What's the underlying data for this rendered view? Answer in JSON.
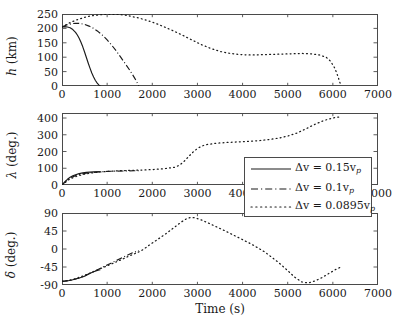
{
  "figure": {
    "xlabel": "Time (s)",
    "background": "#ffffff",
    "axis_color": "#4a4a4a",
    "curve_color": "#1a1a1a"
  },
  "legend": {
    "position": "center-right",
    "entries": [
      {
        "label": "Δv = 0.15v",
        "sub": "p",
        "style": "solid",
        "name": "legend-entry-0-15vp"
      },
      {
        "label": "Δv = 0.1v",
        "sub": "p",
        "style": "dashdot",
        "name": "legend-entry-0-1vp"
      },
      {
        "label": "Δv = 0.0895v",
        "sub": "p",
        "style": "dotted",
        "name": "legend-entry-0-0895vp"
      }
    ]
  },
  "chart_data": [
    {
      "type": "line",
      "panel": "top",
      "title": "",
      "xlabel": "",
      "ylabel": "h (km)",
      "ylabel_symbol": "h",
      "ylabel_unit": "(km)",
      "xlim": [
        0,
        7000
      ],
      "ylim": [
        0,
        250
      ],
      "xticks": [
        0,
        1000,
        2000,
        3000,
        4000,
        5000,
        6000,
        7000
      ],
      "yticks": [
        0,
        50,
        100,
        150,
        200,
        250
      ],
      "grid": false,
      "series": [
        {
          "name": "Δv = 0.15v_p",
          "style": "solid",
          "x": [
            0,
            60,
            120,
            180,
            240,
            300,
            340,
            380,
            420,
            460,
            500,
            540,
            580,
            620,
            660,
            700,
            740,
            780,
            820,
            850
          ],
          "y": [
            205,
            206,
            205,
            202,
            196,
            186,
            177,
            166,
            152,
            136,
            118,
            99,
            80,
            62,
            45,
            31,
            19,
            10,
            3,
            0
          ]
        },
        {
          "name": "Δv = 0.1v_p",
          "style": "dashdot",
          "x": [
            0,
            100,
            200,
            300,
            400,
            500,
            600,
            700,
            800,
            900,
            1000,
            1100,
            1200,
            1300,
            1400,
            1500,
            1600,
            1650,
            1700
          ],
          "y": [
            205,
            212,
            216,
            218,
            217,
            214,
            208,
            200,
            189,
            176,
            160,
            142,
            122,
            100,
            78,
            55,
            30,
            16,
            0
          ]
        },
        {
          "name": "Δv = 0.0895v_p",
          "style": "dotted",
          "x": [
            0,
            150,
            300,
            450,
            600,
            750,
            900,
            1050,
            1200,
            1350,
            1500,
            1700,
            1900,
            2100,
            2300,
            2500,
            2700,
            2900,
            3100,
            3300,
            3500,
            3700,
            3900,
            4100,
            4300,
            4500,
            4700,
            4900,
            5100,
            5300,
            5500,
            5700,
            5850,
            5950,
            6050,
            6120,
            6180
          ],
          "y": [
            205,
            218,
            228,
            236,
            242,
            246,
            248,
            249,
            249,
            247,
            243,
            236,
            227,
            216,
            203,
            189,
            174,
            158,
            143,
            130,
            120,
            114,
            110,
            108,
            108,
            109,
            110,
            111,
            112,
            113,
            112,
            108,
            100,
            86,
            60,
            30,
            0
          ]
        }
      ]
    },
    {
      "type": "line",
      "panel": "middle",
      "title": "",
      "xlabel": "",
      "ylabel": "λ (deg.)",
      "ylabel_symbol": "λ",
      "ylabel_unit": "(deg.)",
      "xlim": [
        0,
        7000
      ],
      "ylim": [
        0,
        430
      ],
      "xticks": [
        0,
        1000,
        2000,
        3000,
        4000,
        5000,
        6000,
        7000
      ],
      "yticks": [
        0,
        100,
        200,
        300,
        400
      ],
      "grid": false,
      "series": [
        {
          "name": "Δv = 0.15v_p",
          "style": "solid",
          "x": [
            0,
            60,
            120,
            180,
            240,
            300,
            380,
            460,
            540,
            620,
            700,
            780,
            850
          ],
          "y": [
            0,
            18,
            34,
            46,
            55,
            61,
            68,
            72,
            75,
            77,
            78,
            79,
            79
          ]
        },
        {
          "name": "Δv = 0.1v_p",
          "style": "dashdot",
          "x": [
            0,
            100,
            200,
            300,
            400,
            500,
            600,
            800,
            1000,
            1200,
            1400,
            1600,
            1700
          ],
          "y": [
            0,
            26,
            44,
            56,
            64,
            69,
            73,
            78,
            81,
            83,
            84,
            85,
            85
          ]
        },
        {
          "name": "Δv = 0.0895v_p",
          "style": "dotted",
          "x": [
            0,
            150,
            300,
            450,
            600,
            800,
            1000,
            1250,
            1500,
            1750,
            2000,
            2250,
            2500,
            2600,
            2700,
            2800,
            2900,
            3000,
            3100,
            3200,
            3400,
            3600,
            3800,
            4000,
            4200,
            4400,
            4600,
            4800,
            5000,
            5200,
            5400,
            5600,
            5800,
            6000,
            6180
          ],
          "y": [
            0,
            32,
            50,
            62,
            70,
            77,
            81,
            85,
            87,
            89,
            92,
            97,
            106,
            118,
            140,
            168,
            196,
            218,
            233,
            241,
            249,
            253,
            256,
            259,
            262,
            266,
            272,
            280,
            292,
            310,
            335,
            362,
            385,
            400,
            408
          ]
        }
      ]
    },
    {
      "type": "line",
      "panel": "bottom",
      "title": "",
      "xlabel": "Time (s)",
      "ylabel": "δ (deg.)",
      "ylabel_symbol": "δ",
      "ylabel_unit": "(deg.)",
      "xlim": [
        0,
        7000
      ],
      "ylim": [
        -90,
        90
      ],
      "xticks": [
        0,
        1000,
        2000,
        3000,
        4000,
        5000,
        6000,
        7000
      ],
      "yticks": [
        -90,
        -45,
        0,
        45,
        90
      ],
      "grid": false,
      "series": [
        {
          "name": "Δv = 0.15v_p",
          "style": "solid",
          "x": [
            0,
            100,
            200,
            300,
            400,
            500,
            600,
            700,
            800,
            850
          ],
          "y": [
            -81,
            -80,
            -78,
            -75,
            -72,
            -68,
            -62,
            -57,
            -53,
            -52
          ]
        },
        {
          "name": "Δv = 0.1v_p",
          "style": "dashdot",
          "x": [
            0,
            200,
            400,
            600,
            800,
            1000,
            1200,
            1400,
            1550,
            1700
          ],
          "y": [
            -81,
            -78,
            -72,
            -62,
            -51,
            -40,
            -29,
            -18,
            -10,
            -4
          ]
        },
        {
          "name": "Δv = 0.0895v_p",
          "style": "dotted",
          "x": [
            0,
            250,
            500,
            750,
            1000,
            1250,
            1500,
            1750,
            2000,
            2250,
            2500,
            2650,
            2750,
            2850,
            2950,
            3100,
            3300,
            3600,
            3900,
            4200,
            4500,
            4800,
            5000,
            5150,
            5300,
            5450,
            5600,
            5750,
            5900,
            6050,
            6180
          ],
          "y": [
            -81,
            -76,
            -66,
            -54,
            -42,
            -30,
            -17,
            -5,
            15,
            34,
            55,
            68,
            75,
            79,
            78,
            72,
            62,
            46,
            29,
            12,
            -8,
            -34,
            -54,
            -70,
            -82,
            -85,
            -80,
            -72,
            -62,
            -52,
            -45
          ]
        }
      ]
    }
  ]
}
